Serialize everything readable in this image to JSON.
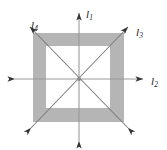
{
  "figure": {
    "background_color": "#ffffff",
    "width": 167,
    "height": 150
  },
  "shape": {
    "name": "square-frame",
    "type": "square annulus (square with square hole)",
    "fill_color": "#b5b5b5",
    "outer": {
      "x": 33,
      "y": 33,
      "width": 91,
      "height": 89
    },
    "inner": {
      "x": 46,
      "y": 46,
      "width": 64,
      "height": 62
    }
  },
  "center": {
    "x": 79,
    "y": 79,
    "dot_color": "#8a8a8a"
  },
  "lines": [
    {
      "id": "l1",
      "label": "l",
      "subscript": "1",
      "orientation": "vertical",
      "stroke_color": "#8f8f8f",
      "arrowheads": "both",
      "from": {
        "x": 79,
        "y": 146
      },
      "to": {
        "x": 79,
        "y": 8
      }
    },
    {
      "id": "l2",
      "label": "l",
      "subscript": "2",
      "orientation": "horizontal",
      "stroke_color": "#8f8f8f",
      "arrowheads": "both",
      "from": {
        "x": 9,
        "y": 79
      },
      "to": {
        "x": 149,
        "y": 79
      }
    },
    {
      "id": "l3",
      "label": "l",
      "subscript": "3",
      "orientation": "diagonal-up-right",
      "stroke_color": "#6f6f6f",
      "arrowheads": "both",
      "from": {
        "x": 26,
        "y": 133
      },
      "to": {
        "x": 133,
        "y": 22
      }
    },
    {
      "id": "l4",
      "label": "l",
      "subscript": "4",
      "orientation": "diagonal-up-left",
      "stroke_color": "#6f6f6f",
      "arrowheads": "both",
      "from": {
        "x": 133,
        "y": 133
      },
      "to": {
        "x": 25,
        "y": 22
      }
    }
  ],
  "labels": {
    "l1": {
      "text": "l",
      "sub": "1"
    },
    "l2": {
      "text": "l",
      "sub": "2"
    },
    "l3": {
      "text": "l",
      "sub": "3"
    },
    "l4": {
      "text": "l",
      "sub": "4"
    }
  }
}
